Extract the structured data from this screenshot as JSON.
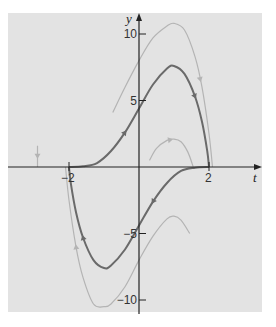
{
  "chart_data": {
    "type": "line",
    "title": "",
    "xlabel": "t",
    "ylabel": "y",
    "xlim": [
      -3.3,
      3.5
    ],
    "ylim": [
      -11.2,
      11.0
    ],
    "grid": false,
    "legend": null,
    "x_ticks": [
      {
        "value": -2,
        "label": "−2"
      },
      {
        "value": 2,
        "label": "2"
      }
    ],
    "y_ticks": [
      {
        "value": 10,
        "label": "10"
      },
      {
        "value": 5,
        "label": "5"
      },
      {
        "value": -5,
        "label": "−5"
      },
      {
        "value": -10,
        "label": "−10"
      }
    ],
    "series": [
      {
        "name": "solution-upper",
        "style": "dark",
        "color": "#6a6a6a",
        "points": [
          [
            -2,
            0
          ],
          [
            -1.6,
            0.05
          ],
          [
            -1.2,
            0.3
          ],
          [
            -0.8,
            1.2
          ],
          [
            -0.4,
            2.6
          ],
          [
            0,
            4.4
          ],
          [
            0.4,
            6.2
          ],
          [
            0.8,
            7.4
          ],
          [
            1.0,
            7.6
          ],
          [
            1.3,
            7.0
          ],
          [
            1.6,
            5.3
          ],
          [
            1.8,
            3.4
          ],
          [
            1.95,
            1.2
          ],
          [
            2,
            0
          ]
        ],
        "arrows": [
          {
            "t": -0.4,
            "dir": "forward"
          },
          {
            "t": 1.6,
            "dir": "forward"
          }
        ]
      },
      {
        "name": "solution-lower",
        "style": "dark",
        "color": "#6a6a6a",
        "points": [
          [
            -2,
            0
          ],
          [
            -1.95,
            -1.2
          ],
          [
            -1.8,
            -3.4
          ],
          [
            -1.6,
            -5.3
          ],
          [
            -1.3,
            -7.0
          ],
          [
            -1.0,
            -7.6
          ],
          [
            -0.8,
            -7.4
          ],
          [
            -0.4,
            -6.2
          ],
          [
            0,
            -4.4
          ],
          [
            0.4,
            -2.6
          ],
          [
            0.8,
            -1.2
          ],
          [
            1.2,
            -0.3
          ],
          [
            1.6,
            -0.05
          ],
          [
            2,
            0
          ]
        ],
        "arrows": [
          {
            "t": -1.6,
            "dir": "backward"
          },
          {
            "t": 0.4,
            "dir": "backward"
          }
        ]
      },
      {
        "name": "nearby-upper",
        "style": "light",
        "color": "#b4b4b4",
        "points": [
          [
            -0.75,
            4.1
          ],
          [
            -0.4,
            6.0
          ],
          [
            0,
            8.0
          ],
          [
            0.4,
            9.7
          ],
          [
            0.8,
            10.6
          ],
          [
            1.0,
            10.8
          ],
          [
            1.3,
            10.3
          ],
          [
            1.6,
            8.3
          ],
          [
            1.8,
            6.0
          ],
          [
            2.0,
            2.5
          ],
          [
            2.1,
            0
          ]
        ],
        "arrows": [
          {
            "t": 1.75,
            "dir": "forward"
          }
        ]
      },
      {
        "name": "nearby-lower",
        "style": "light",
        "color": "#b4b4b4",
        "points": [
          [
            -2.1,
            0
          ],
          [
            -2.0,
            -2.5
          ],
          [
            -1.8,
            -6.0
          ],
          [
            -1.6,
            -8.3
          ],
          [
            -1.3,
            -10.3
          ],
          [
            -1.0,
            -10.5
          ],
          [
            -0.8,
            -10.3
          ],
          [
            -0.4,
            -9.0
          ],
          [
            0,
            -7.0
          ],
          [
            0.4,
            -5.2
          ],
          [
            0.8,
            -3.9
          ],
          [
            1.0,
            -3.7
          ],
          [
            1.2,
            -4.0
          ],
          [
            1.45,
            -5.0
          ]
        ],
        "arrows": [
          {
            "t": -1.8,
            "dir": "backward"
          }
        ]
      },
      {
        "name": "small-arc",
        "style": "light",
        "color": "#b4b4b4",
        "points": [
          [
            0.3,
            0.5
          ],
          [
            0.5,
            1.4
          ],
          [
            0.8,
            2.0
          ],
          [
            1.0,
            2.1
          ],
          [
            1.2,
            1.9
          ],
          [
            1.4,
            1.1
          ],
          [
            1.55,
            0
          ]
        ],
        "arrows": [
          {
            "t": 0.9,
            "dir": "forward"
          }
        ]
      },
      {
        "name": "left-stub",
        "style": "light",
        "color": "#b4b4b4",
        "points": [
          [
            -2.9,
            1.6
          ],
          [
            -2.9,
            0
          ]
        ],
        "arrows": [
          {
            "t": -2.9,
            "dir": "down"
          }
        ]
      }
    ]
  },
  "axes": {
    "x_label": "t",
    "y_label": "y"
  }
}
